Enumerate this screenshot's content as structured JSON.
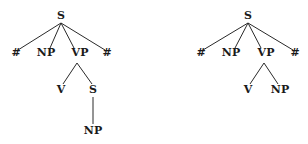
{
  "trees": [
    {
      "name": "left-tree",
      "nodes": [
        {
          "id": "S",
          "label": "S",
          "x": 61,
          "y": 19
        },
        {
          "id": "H1",
          "label": "#",
          "x": 16,
          "y": 56
        },
        {
          "id": "NP1",
          "label": "NP",
          "x": 46,
          "y": 56
        },
        {
          "id": "VP",
          "label": "VP",
          "x": 80,
          "y": 56
        },
        {
          "id": "H2",
          "label": "#",
          "x": 107,
          "y": 56
        },
        {
          "id": "V",
          "label": "V",
          "x": 61,
          "y": 93
        },
        {
          "id": "S2",
          "label": "S",
          "x": 93,
          "y": 93
        },
        {
          "id": "NP2",
          "label": "NP",
          "x": 93,
          "y": 134
        }
      ],
      "edges": [
        {
          "x1": 61,
          "y1": 23,
          "x2": 18,
          "y2": 50
        },
        {
          "x1": 61,
          "y1": 23,
          "x2": 50,
          "y2": 48
        },
        {
          "x1": 61,
          "y1": 23,
          "x2": 74,
          "y2": 48
        },
        {
          "x1": 61,
          "y1": 23,
          "x2": 105,
          "y2": 50
        },
        {
          "x1": 77,
          "y1": 63,
          "x2": 63,
          "y2": 84
        },
        {
          "x1": 77,
          "y1": 63,
          "x2": 92,
          "y2": 84
        },
        {
          "x1": 93,
          "y1": 97,
          "x2": 93,
          "y2": 124
        }
      ]
    },
    {
      "name": "right-tree",
      "nodes": [
        {
          "id": "S",
          "label": "S",
          "x": 248,
          "y": 19
        },
        {
          "id": "H1",
          "label": "#",
          "x": 201,
          "y": 56
        },
        {
          "id": "NP1",
          "label": "NP",
          "x": 231,
          "y": 56
        },
        {
          "id": "VP",
          "label": "VP",
          "x": 266,
          "y": 56
        },
        {
          "id": "H2",
          "label": "#",
          "x": 295,
          "y": 56
        },
        {
          "id": "V",
          "label": "V",
          "x": 248,
          "y": 93
        },
        {
          "id": "NP2",
          "label": "NP",
          "x": 280,
          "y": 93
        }
      ],
      "edges": [
        {
          "x1": 248,
          "y1": 23,
          "x2": 203,
          "y2": 50
        },
        {
          "x1": 248,
          "y1": 23,
          "x2": 235,
          "y2": 48
        },
        {
          "x1": 248,
          "y1": 23,
          "x2": 261,
          "y2": 48
        },
        {
          "x1": 248,
          "y1": 23,
          "x2": 293,
          "y2": 50
        },
        {
          "x1": 264,
          "y1": 63,
          "x2": 250,
          "y2": 84
        },
        {
          "x1": 264,
          "y1": 63,
          "x2": 278,
          "y2": 84
        }
      ]
    }
  ]
}
